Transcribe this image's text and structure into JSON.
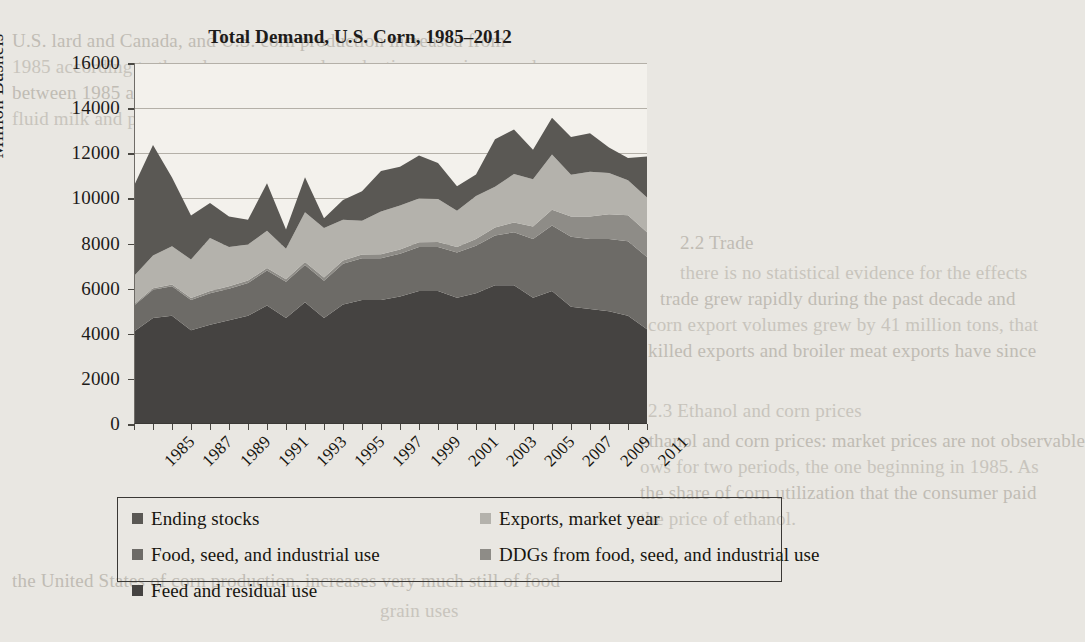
{
  "page": {
    "background_color": "#e9e7e2",
    "bleed_text": [
      {
        "text": "U.S. lard and Canada, and U.S. corn production increased from",
        "x": 12,
        "y": 30
      },
      {
        "text": "1985 according to these long-run annual production were increased",
        "x": 12,
        "y": 56
      },
      {
        "text": "between 1985 and 2006.  Meat, poultry and broiler processing for",
        "x": 12,
        "y": 82
      },
      {
        "text": "fluid milk and poultry production in the United States and for",
        "x": 12,
        "y": 108
      },
      {
        "text": "2.2 Trade",
        "x": 680,
        "y": 232
      },
      {
        "text": "there is no statistical evidence for the effects",
        "x": 680,
        "y": 262
      },
      {
        "text": "trade grew rapidly during the past decade and",
        "x": 660,
        "y": 288
      },
      {
        "text": "corn export volumes grew by 41 million tons, that",
        "x": 648,
        "y": 314
      },
      {
        "text": "killed exports and broiler meat exports have since",
        "x": 648,
        "y": 340
      },
      {
        "text": "2.3 Ethanol and corn prices",
        "x": 648,
        "y": 400
      },
      {
        "text": "ethanol and corn prices: market prices are not observable",
        "x": 640,
        "y": 430
      },
      {
        "text": "ows for two periods, the one beginning in 1985.  As",
        "x": 640,
        "y": 456
      },
      {
        "text": "the share of corn utilization that the consumer paid",
        "x": 640,
        "y": 482
      },
      {
        "text": "the price of ethanol.",
        "x": 640,
        "y": 508
      },
      {
        "text": "the United States of corn production, increases very much still of food",
        "x": 12,
        "y": 570
      },
      {
        "text": "grain uses",
        "x": 380,
        "y": 600
      }
    ]
  },
  "chart_data": {
    "type": "area",
    "stacked": true,
    "title": "Total Demand, U.S. Corn, 1985–2012",
    "xlabel": "",
    "ylabel": "Million Bushels",
    "ylim": [
      0,
      16000
    ],
    "ytick_step": 2000,
    "yticks": [
      0,
      2000,
      4000,
      6000,
      8000,
      10000,
      12000,
      14000,
      16000
    ],
    "grid": true,
    "legend_position": "bottom",
    "x": [
      1985,
      1986,
      1987,
      1988,
      1989,
      1990,
      1991,
      1992,
      1993,
      1994,
      1995,
      1996,
      1997,
      1998,
      1999,
      2000,
      2001,
      2002,
      2003,
      2004,
      2005,
      2006,
      2007,
      2008,
      2009,
      2010,
      2011,
      2012
    ],
    "xtick_labels": [
      "1985",
      "1987",
      "1989",
      "1991",
      "1993",
      "1995",
      "1997",
      "1999",
      "2001",
      "2003",
      "2005",
      "2007",
      "2009",
      "2011"
    ],
    "series": [
      {
        "name": "Feed and residual use",
        "color": "#454341",
        "values": [
          4100,
          4700,
          4800,
          4150,
          4400,
          4600,
          4800,
          5250,
          4700,
          5400,
          4700,
          5300,
          5500,
          5500,
          5650,
          5900,
          5900,
          5600,
          5800,
          6150,
          6150,
          5600,
          5900,
          5200,
          5100,
          5000,
          4800,
          4200
        ]
      },
      {
        "name": "Food, seed, and industrial use",
        "color": "#6d6b67",
        "values": [
          1150,
          1250,
          1300,
          1350,
          1400,
          1400,
          1450,
          1550,
          1600,
          1650,
          1650,
          1800,
          1850,
          1850,
          1900,
          1950,
          1950,
          2000,
          2100,
          2200,
          2350,
          2600,
          2900,
          3100,
          3100,
          3200,
          3300,
          3200
        ]
      },
      {
        "name": "DDGs from food, seed, and industrial use",
        "color": "#8e8c87",
        "values": [
          60,
          70,
          80,
          90,
          95,
          100,
          105,
          115,
          120,
          130,
          140,
          150,
          160,
          170,
          180,
          200,
          220,
          250,
          300,
          360,
          430,
          550,
          700,
          900,
          1000,
          1100,
          1150,
          1100
        ]
      },
      {
        "name": "Exports, market year",
        "color": "#b4b2ac",
        "values": [
          1250,
          1450,
          1700,
          1700,
          2350,
          1750,
          1600,
          1650,
          1350,
          2200,
          2200,
          1800,
          1500,
          1900,
          1950,
          1950,
          1900,
          1600,
          1900,
          1800,
          2150,
          2100,
          2450,
          1850,
          1980,
          1830,
          1550,
          1540
        ]
      },
      {
        "name": "Ending stocks",
        "color": "#5a5854",
        "values": [
          4000,
          4900,
          3050,
          1950,
          1550,
          1350,
          1100,
          2100,
          850,
          1560,
          430,
          880,
          1310,
          1790,
          1720,
          1900,
          1600,
          1090,
          960,
          2110,
          1970,
          1300,
          1620,
          1670,
          1710,
          1130,
          990,
          1820
        ]
      }
    ],
    "legend_entries": [
      {
        "label": "Ending stocks",
        "color": "#5a5854"
      },
      {
        "label": "Exports, market year",
        "color": "#b4b2ac"
      },
      {
        "label": "Food, seed, and industrial use",
        "color": "#6d6b67"
      },
      {
        "label": "DDGs from food, seed, and industrial use",
        "color": "#8e8c87"
      },
      {
        "label": "Feed and residual use",
        "color": "#454341"
      }
    ]
  }
}
